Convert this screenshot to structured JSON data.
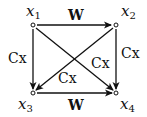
{
  "diagram": {
    "nodes": [
      {
        "id": "x1",
        "base": "x",
        "sub": "1"
      },
      {
        "id": "x2",
        "base": "x",
        "sub": "2"
      },
      {
        "id": "x3",
        "base": "x",
        "sub": "3"
      },
      {
        "id": "x4",
        "base": "x",
        "sub": "4"
      }
    ],
    "edges": [
      {
        "from": "x1",
        "to": "x2",
        "label": "W"
      },
      {
        "from": "x3",
        "to": "x4",
        "label": "W"
      },
      {
        "from": "x1",
        "to": "x3",
        "label": "Cx"
      },
      {
        "from": "x2",
        "to": "x4",
        "label": "Cx"
      },
      {
        "from": "x1",
        "to": "x4",
        "label": "Cx"
      },
      {
        "from": "x2",
        "to": "x3",
        "label": "Cx"
      }
    ]
  }
}
